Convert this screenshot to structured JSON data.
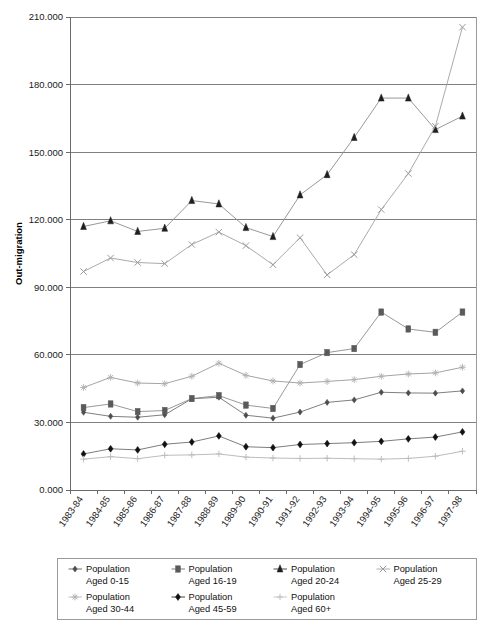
{
  "chart_data": {
    "type": "line",
    "title": "",
    "xlabel": "",
    "ylabel": "Out-migration",
    "ylim": [
      0,
      210000
    ],
    "ytick_step": 30000,
    "ytick_labels": [
      "0.000",
      "30.000",
      "60.000",
      "90.000",
      "120.000",
      "150.000",
      "180.000",
      "210.000"
    ],
    "ytick_values": [
      0,
      30000,
      60000,
      90000,
      120000,
      150000,
      180000,
      210000
    ],
    "grid": true,
    "legend_position": "bottom",
    "categories": [
      "1983-84",
      "1984-85",
      "1985-86",
      "1986-87",
      "1987-88",
      "1988-89",
      "1989-90",
      "1990-91",
      "1991-92",
      "1992-93",
      "1993-94",
      "1994-95",
      "1995-96",
      "1996-97",
      "1997-98"
    ],
    "series": [
      {
        "name": "Population Aged 0-15",
        "label_line1": "Population",
        "label_line2": "Aged 0-15",
        "marker": "diamond",
        "color": "#4d4d4d",
        "line_color": "#707070",
        "values": [
          34500,
          32700,
          32300,
          33400,
          40500,
          41200,
          33200,
          31900,
          34600,
          38900,
          40000,
          43400,
          43100,
          43000,
          44000
        ]
      },
      {
        "name": "Population Aged 16-19",
        "label_line1": "Population",
        "label_line2": "Aged 16-19",
        "marker": "square",
        "color": "#5a5a5a",
        "line_color": "#8c8c8c",
        "values": [
          36600,
          38200,
          34800,
          35300,
          40600,
          41900,
          37700,
          36200,
          55700,
          61000,
          62800,
          79000,
          71500,
          70000,
          79000
        ]
      },
      {
        "name": "Population Aged 20-24",
        "label_line1": "Population",
        "label_line2": "Aged 20-24",
        "marker": "triangle",
        "color": "#1f1f1f",
        "line_color": "#8c8c8c",
        "values": [
          117000,
          119500,
          114800,
          116200,
          128500,
          127000,
          116500,
          112500,
          131000,
          140000,
          156500,
          174000,
          174000,
          160000,
          166000
        ]
      },
      {
        "name": "Population Aged 25-29",
        "label_line1": "Population",
        "label_line2": "Aged 25-29",
        "marker": "cross",
        "color": "#9a9a9a",
        "line_color": "#a0a0a0",
        "values": [
          97000,
          103000,
          101000,
          100500,
          109000,
          114500,
          108500,
          100000,
          112000,
          95500,
          104500,
          124500,
          140500,
          161500,
          205500
        ]
      },
      {
        "name": "Population Aged 30-44",
        "label_line1": "Population",
        "label_line2": "Aged 30-44",
        "marker": "star",
        "color": "#b0b0b0",
        "line_color": "#9a9a9a",
        "values": [
          45500,
          50000,
          47500,
          47200,
          50500,
          56300,
          50900,
          48400,
          47500,
          48200,
          49000,
          50500,
          51500,
          52000,
          54500
        ]
      },
      {
        "name": "Population Aged 45-59",
        "label_line1": "Population",
        "label_line2": "Aged 45-59",
        "marker": "filled-diamond",
        "color": "#111111",
        "line_color": "#6e6e6e",
        "values": [
          16000,
          18300,
          17800,
          20300,
          21300,
          24000,
          19200,
          18800,
          20200,
          20600,
          21000,
          21600,
          22700,
          23500,
          25800
        ]
      },
      {
        "name": "Population Aged 60+",
        "label_line1": "Population",
        "label_line2": "Aged 60+",
        "marker": "plus",
        "color": "#bdbdbd",
        "line_color": "#b4b4b4",
        "values": [
          13700,
          14800,
          13900,
          15400,
          15600,
          16000,
          14600,
          14200,
          14000,
          14100,
          13900,
          13700,
          14000,
          15000,
          17200
        ]
      }
    ]
  },
  "chart": {
    "axis_title": "Out-migration"
  },
  "caption": {
    "text": ""
  }
}
